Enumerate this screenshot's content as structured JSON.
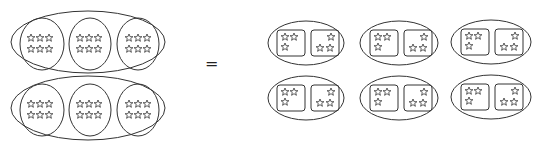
{
  "diagram": {
    "operator": "=",
    "colors": {
      "stroke": "#333333",
      "background": "#ffffff"
    },
    "left_side": {
      "outer_groups": 2,
      "inner_groups_per_outer": 3,
      "stars_per_inner_group": 6,
      "inner_group_shape": "circle",
      "star_arrangement": "3x2 grid"
    },
    "right_side": {
      "outer_groups": 6,
      "layout": "2 rows x 3 columns",
      "inner_groups_per_outer": 2,
      "stars_per_inner_group": 3,
      "inner_group_shape": "rounded square",
      "star_arrangement": [
        "2 top + 1 bottom-left",
        "1 top-right + 2 bottom"
      ]
    },
    "total_stars": 36
  }
}
